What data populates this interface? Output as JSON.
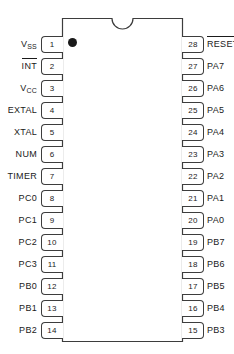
{
  "diagram": {
    "type": "dip-package-pinout",
    "package": "28-pin DIP",
    "pin_count": 28,
    "notch": "top-center-semicircle",
    "pin1_marker": "dot",
    "colors": {
      "outline": "#3d3d3d",
      "text": "#1a1a1a",
      "background": "#ffffff"
    }
  },
  "pins_left": [
    {
      "number": "1",
      "name": "V",
      "sub": "SS",
      "overline": false
    },
    {
      "number": "2",
      "name": "INT",
      "sub": "",
      "overline": true
    },
    {
      "number": "3",
      "name": "V",
      "sub": "CC",
      "overline": false
    },
    {
      "number": "4",
      "name": "EXTAL",
      "sub": "",
      "overline": false
    },
    {
      "number": "5",
      "name": "XTAL",
      "sub": "",
      "overline": false
    },
    {
      "number": "6",
      "name": "NUM",
      "sub": "",
      "overline": false
    },
    {
      "number": "7",
      "name": "TIMER",
      "sub": "",
      "overline": false
    },
    {
      "number": "8",
      "name": "PC0",
      "sub": "",
      "overline": false
    },
    {
      "number": "9",
      "name": "PC1",
      "sub": "",
      "overline": false
    },
    {
      "number": "10",
      "name": "PC2",
      "sub": "",
      "overline": false
    },
    {
      "number": "11",
      "name": "PC3",
      "sub": "",
      "overline": false
    },
    {
      "number": "12",
      "name": "PB0",
      "sub": "",
      "overline": false
    },
    {
      "number": "13",
      "name": "PB1",
      "sub": "",
      "overline": false
    },
    {
      "number": "14",
      "name": "PB2",
      "sub": "",
      "overline": false
    }
  ],
  "pins_right": [
    {
      "number": "28",
      "name": "RESET",
      "sub": "",
      "overline": true
    },
    {
      "number": "27",
      "name": "PA7",
      "sub": "",
      "overline": false
    },
    {
      "number": "26",
      "name": "PA6",
      "sub": "",
      "overline": false
    },
    {
      "number": "25",
      "name": "PA5",
      "sub": "",
      "overline": false
    },
    {
      "number": "24",
      "name": "PA4",
      "sub": "",
      "overline": false
    },
    {
      "number": "23",
      "name": "PA3",
      "sub": "",
      "overline": false
    },
    {
      "number": "22",
      "name": "PA2",
      "sub": "",
      "overline": false
    },
    {
      "number": "21",
      "name": "PA1",
      "sub": "",
      "overline": false
    },
    {
      "number": "20",
      "name": "PA0",
      "sub": "",
      "overline": false
    },
    {
      "number": "19",
      "name": "PB7",
      "sub": "",
      "overline": false
    },
    {
      "number": "18",
      "name": "PB6",
      "sub": "",
      "overline": false
    },
    {
      "number": "17",
      "name": "PB5",
      "sub": "",
      "overline": false
    },
    {
      "number": "16",
      "name": "PB4",
      "sub": "",
      "overline": false
    },
    {
      "number": "15",
      "name": "PB3",
      "sub": "",
      "overline": false
    }
  ]
}
